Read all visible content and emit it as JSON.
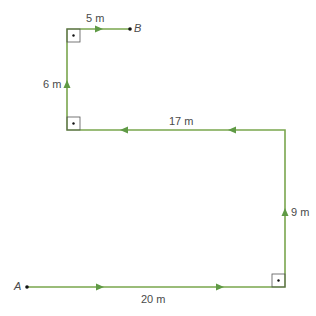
{
  "colors": {
    "path": "#7aa64e",
    "arrow": "#5f9a45",
    "text": "#4a4a4a",
    "point": "#111111",
    "square": "#555555"
  },
  "points": {
    "start": "A",
    "end": "B"
  },
  "segments": [
    {
      "label": "20 m",
      "direction": "east"
    },
    {
      "label": "9 m",
      "direction": "north"
    },
    {
      "label": "17 m",
      "direction": "west"
    },
    {
      "label": "6 m",
      "direction": "north"
    },
    {
      "label": "5 m",
      "direction": "east"
    }
  ]
}
